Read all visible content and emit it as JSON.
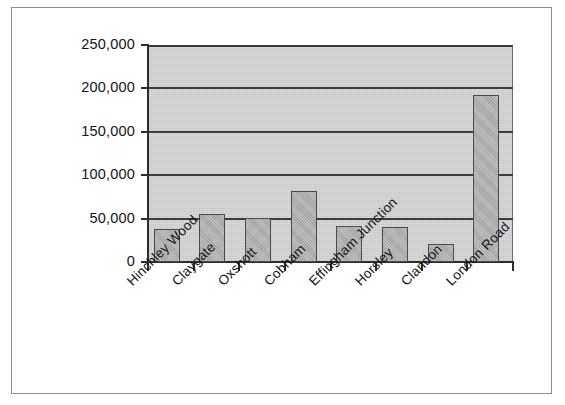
{
  "chart_data": {
    "type": "bar",
    "title": "",
    "subtitle": "",
    "xlabel": "",
    "ylabel": "",
    "categories": [
      "Hinchley Wood",
      "Claygate",
      "Oxshott",
      "Cobham",
      "Effingham Junction",
      "Horsley",
      "Clandon",
      "London Road"
    ],
    "values": [
      38000,
      55000,
      51000,
      82000,
      42000,
      40000,
      21000,
      192000
    ],
    "ylim": [
      0,
      250000
    ],
    "ytick_values": [
      0,
      50000,
      100000,
      150000,
      200000,
      250000
    ],
    "ytick_labels": [
      "0",
      "50,000",
      "100,000",
      "150,000",
      "200,000",
      "250,000"
    ],
    "grid": true,
    "grid_axis": "y",
    "legend": false,
    "legend_position": "none",
    "xtick_label_rotation": -45,
    "series": [
      {
        "name": "",
        "values": [
          38000,
          55000,
          51000,
          82000,
          42000,
          40000,
          21000,
          192000
        ]
      }
    ]
  },
  "style": {
    "plot_background": "#c8c8c8",
    "bar_fill": "#a9a9a9",
    "bar_border": "#4a4a4a",
    "gridline_color": "#3c3c3c",
    "axis_color": "#2d2d2d",
    "text_color": "#141414",
    "page_background": "#ffffff",
    "frame_border": "#8e8e8e"
  }
}
